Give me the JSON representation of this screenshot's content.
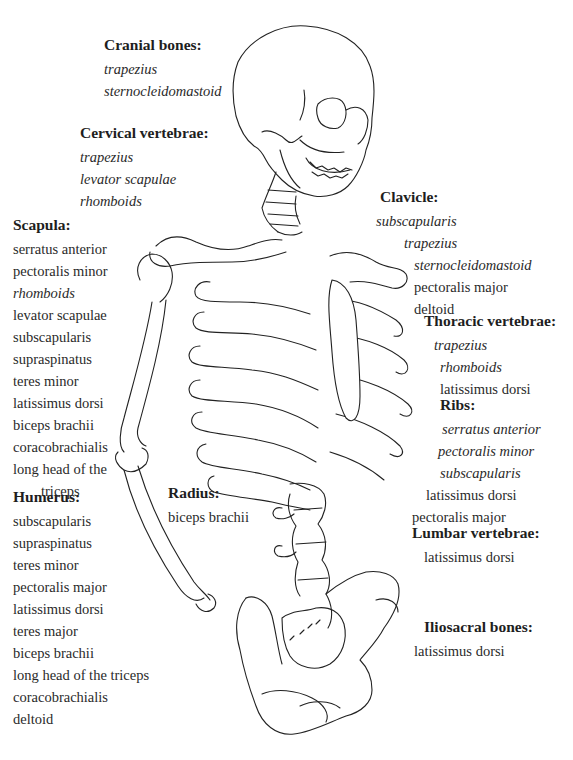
{
  "figure": {
    "line_color": "#222222",
    "background": "#ffffff"
  },
  "labels": {
    "cranial": {
      "title": "Cranial bones:",
      "items": [
        {
          "text": "trapezius",
          "italic": true
        },
        {
          "text": "sternocleidomastoid",
          "italic": true
        }
      ]
    },
    "cervical": {
      "title": "Cervical vertebrae:",
      "items": [
        {
          "text": "trapezius",
          "italic": true
        },
        {
          "text": "levator scapulae",
          "italic": true
        },
        {
          "text": "rhomboids",
          "italic": true
        }
      ]
    },
    "scapula": {
      "title": "Scapula:",
      "items": [
        {
          "text": "serratus anterior",
          "italic": false
        },
        {
          "text": "pectoralis minor",
          "italic": false
        },
        {
          "text": "rhomboids",
          "italic": true
        },
        {
          "text": "levator scapulae",
          "italic": false
        },
        {
          "text": "subscapularis",
          "italic": false
        },
        {
          "text": "supraspinatus",
          "italic": false
        },
        {
          "text": "teres minor",
          "italic": false
        },
        {
          "text": "latissimus dorsi",
          "italic": false
        },
        {
          "text": "biceps brachii",
          "italic": false
        },
        {
          "text": "coracobrachialis",
          "italic": false
        },
        {
          "text": "long head of the",
          "italic": false
        },
        {
          "text": "triceps",
          "italic": false
        }
      ]
    },
    "humerus": {
      "title": "Humerus:",
      "items": [
        {
          "text": "subscapularis",
          "italic": false
        },
        {
          "text": "supraspinatus",
          "italic": false
        },
        {
          "text": "teres minor",
          "italic": false
        },
        {
          "text": "pectoralis major",
          "italic": false
        },
        {
          "text": "latissimus dorsi",
          "italic": false
        },
        {
          "text": "teres major",
          "italic": false
        },
        {
          "text": "biceps brachii",
          "italic": false
        },
        {
          "text": "long head of the triceps",
          "italic": false
        },
        {
          "text": "coracobrachialis",
          "italic": false
        },
        {
          "text": "deltoid",
          "italic": false
        }
      ]
    },
    "radius": {
      "title": "Radius:",
      "items": [
        {
          "text": "biceps brachii",
          "italic": false
        }
      ]
    },
    "clavicle": {
      "title": "Clavicle:",
      "items": [
        {
          "text": "subscapularis",
          "italic": true
        },
        {
          "text": "trapezius",
          "italic": true
        },
        {
          "text": "sternocleidomastoid",
          "italic": true
        },
        {
          "text": "pectoralis major",
          "italic": false
        },
        {
          "text": "deltoid",
          "italic": false
        }
      ]
    },
    "thoracic": {
      "title": "Thoracic vertebrae:",
      "items": [
        {
          "text": "trapezius",
          "italic": true
        },
        {
          "text": "rhomboids",
          "italic": true
        },
        {
          "text": "latissimus dorsi",
          "italic": false
        }
      ]
    },
    "ribs": {
      "title": "Ribs:",
      "items": [
        {
          "text": "serratus anterior",
          "italic": true
        },
        {
          "text": "pectoralis minor",
          "italic": true
        },
        {
          "text": "subscapularis",
          "italic": true
        },
        {
          "text": "latissimus dorsi",
          "italic": false
        },
        {
          "text": "pectoralis major",
          "italic": false
        }
      ]
    },
    "lumbar": {
      "title": "Lumbar vertebrae:",
      "items": [
        {
          "text": "latissimus dorsi",
          "italic": false
        }
      ]
    },
    "iliosacral": {
      "title": "Iliosacral bones:",
      "items": [
        {
          "text": "latissimus dorsi",
          "italic": false
        }
      ]
    }
  }
}
